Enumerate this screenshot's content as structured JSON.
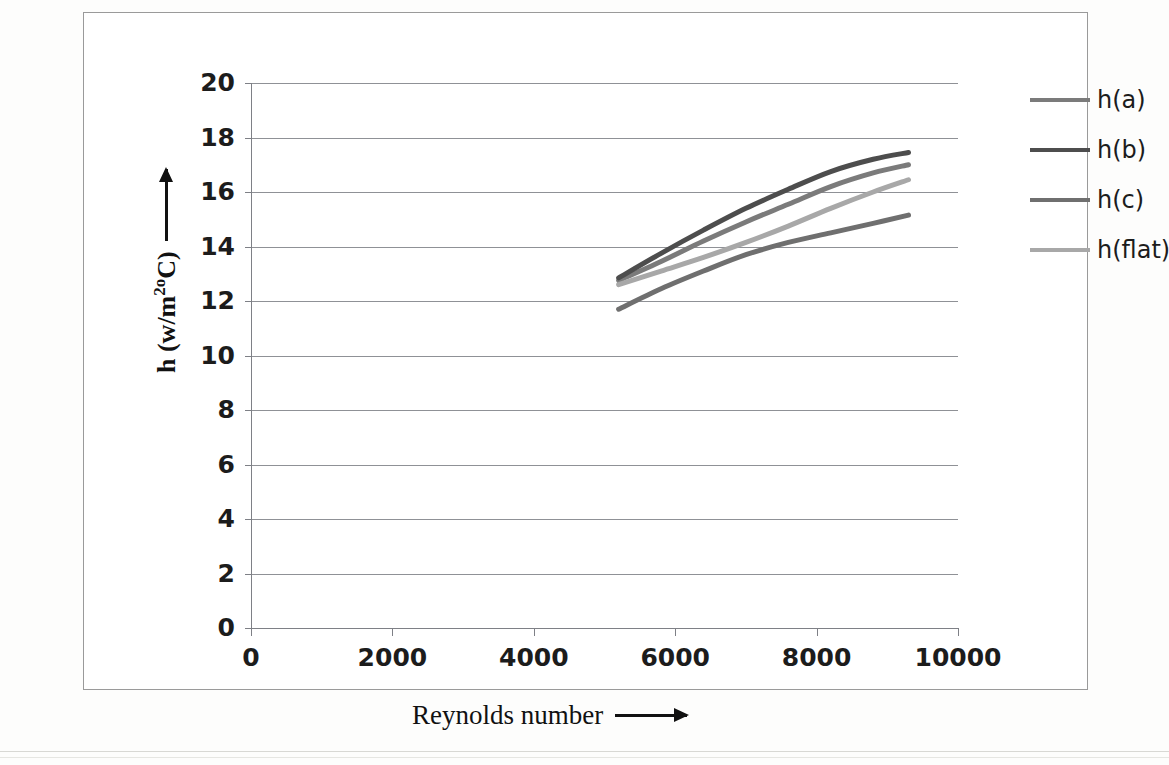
{
  "page": {
    "top_caption_fragment": "",
    "background": "#ffffff"
  },
  "chart_data": {
    "type": "line",
    "title": "",
    "xlabel": "Reynolds number",
    "ylabel": "h  (w/m2oC)",
    "ylabel_parts": {
      "base": "h  (w/m",
      "sup": "2o",
      "tail": "C)"
    },
    "xlim": [
      0,
      10000
    ],
    "ylim": [
      0,
      20
    ],
    "xticks": [
      "0",
      "2000",
      "4000",
      "6000",
      "8000",
      "10000"
    ],
    "xtick_values": [
      0,
      2000,
      4000,
      6000,
      8000,
      10000
    ],
    "yticks": [
      "0",
      "2",
      "4",
      "6",
      "8",
      "10",
      "12",
      "14",
      "16",
      "18",
      "20"
    ],
    "ytick_values": [
      0,
      2,
      4,
      6,
      8,
      10,
      12,
      14,
      16,
      18,
      20
    ],
    "grid": true,
    "grid_axis": "y",
    "legend_position": "right",
    "x": [
      5200,
      5800,
      6400,
      7000,
      7600,
      8200,
      8800,
      9300
    ],
    "series": [
      {
        "name": "h(a)",
        "color": "#7b7b7b",
        "values": [
          12.75,
          13.45,
          14.2,
          14.9,
          15.55,
          16.2,
          16.7,
          17.0
        ]
      },
      {
        "name": "h(b)",
        "color": "#4d4d4d",
        "values": [
          12.85,
          13.75,
          14.6,
          15.4,
          16.1,
          16.75,
          17.2,
          17.45
        ]
      },
      {
        "name": "h(c)",
        "color": "#6f6f6f",
        "values": [
          11.7,
          12.45,
          13.1,
          13.7,
          14.15,
          14.5,
          14.85,
          15.15
        ]
      },
      {
        "name": "h(flat)",
        "color": "#a8a8a8",
        "values": [
          12.6,
          13.1,
          13.6,
          14.15,
          14.75,
          15.4,
          16.0,
          16.45
        ]
      }
    ]
  },
  "legend": {
    "items": [
      {
        "label": "h(a)",
        "color": "#7b7b7b"
      },
      {
        "label": "h(b)",
        "color": "#4d4d4d"
      },
      {
        "label": "h(c)",
        "color": "#6f6f6f"
      },
      {
        "label": "h(flat)",
        "color": "#a8a8a8"
      }
    ]
  },
  "axis_titles": {
    "x": "Reynolds number",
    "y_base": "h  (w/m",
    "y_sup": "2o",
    "y_tail": "C)"
  }
}
